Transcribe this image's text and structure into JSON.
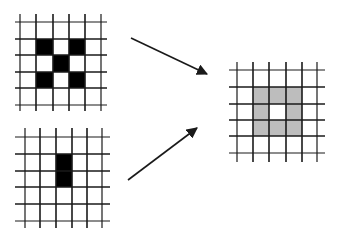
{
  "diagram": {
    "colors": {
      "background": "#ffffff",
      "grid_line": "#1a1a1a",
      "filled_black": "#000000",
      "filled_gray": "#bdbdbd",
      "arrow": "#1a1a1a"
    },
    "grids": [
      {
        "id": "input-top",
        "x_lines": [
          20,
          36,
          53,
          69,
          85,
          101
        ],
        "y_lines": [
          22,
          39,
          55,
          72,
          88,
          105
        ],
        "line_extent": {
          "x": [
            15,
            107
          ],
          "y": [
            14,
            111
          ]
        },
        "cells": [
          {
            "col": 1,
            "row": 1,
            "fill": "black"
          },
          {
            "col": 3,
            "row": 1,
            "fill": "black"
          },
          {
            "col": 2,
            "row": 2,
            "fill": "black"
          },
          {
            "col": 1,
            "row": 3,
            "fill": "black"
          },
          {
            "col": 3,
            "row": 3,
            "fill": "black"
          }
        ]
      },
      {
        "id": "input-bottom",
        "x_lines": [
          25,
          40,
          56,
          72,
          87,
          102
        ],
        "y_lines": [
          137,
          154,
          171,
          187,
          204,
          221
        ],
        "line_extent": {
          "x": [
            15,
            110
          ],
          "y": [
            128,
            228
          ]
        },
        "cells": [
          {
            "col": 2,
            "row": 1,
            "fill": "black"
          },
          {
            "col": 2,
            "row": 2,
            "fill": "black"
          }
        ]
      },
      {
        "id": "output-right",
        "x_lines": [
          237,
          253,
          269,
          286,
          302,
          317
        ],
        "y_lines": [
          70,
          87,
          104,
          120,
          136,
          153
        ],
        "line_extent": {
          "x": [
            229,
            325
          ],
          "y": [
            62,
            162
          ]
        },
        "cells": [
          {
            "col": 1,
            "row": 1,
            "fill": "gray"
          },
          {
            "col": 2,
            "row": 1,
            "fill": "gray"
          },
          {
            "col": 3,
            "row": 1,
            "fill": "gray"
          },
          {
            "col": 1,
            "row": 2,
            "fill": "gray"
          },
          {
            "col": 3,
            "row": 2,
            "fill": "gray"
          },
          {
            "col": 1,
            "row": 3,
            "fill": "gray"
          },
          {
            "col": 2,
            "row": 3,
            "fill": "gray"
          },
          {
            "col": 3,
            "row": 3,
            "fill": "gray"
          }
        ]
      }
    ],
    "arrows": [
      {
        "id": "arrow-top-to-output",
        "from": [
          131,
          38
        ],
        "to": [
          207,
          74
        ]
      },
      {
        "id": "arrow-bottom-to-output",
        "from": [
          128,
          180
        ],
        "to": [
          197,
          128
        ]
      }
    ]
  }
}
